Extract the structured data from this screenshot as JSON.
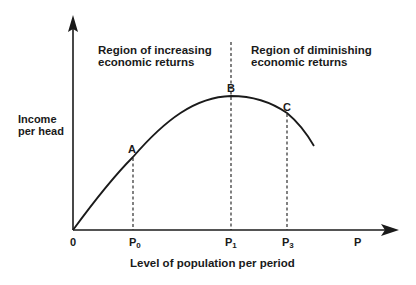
{
  "diagram": {
    "y_axis_label_line1": "Income",
    "y_axis_label_line2": "per head",
    "x_axis_label": "Level of population per period",
    "origin_label": "0",
    "region_left_line1": "Region of increasing",
    "region_left_line2": "economic returns",
    "region_right_line1": "Region of diminishing",
    "region_right_line2": "economic returns",
    "points": [
      {
        "label": "A",
        "x_tick": "P",
        "x_tick_sub": "0"
      },
      {
        "label": "B",
        "x_tick": "P",
        "x_tick_sub": "1"
      },
      {
        "label": "C",
        "x_tick": "P",
        "x_tick_sub": "3"
      }
    ],
    "x_axis_end_label": "P",
    "colors": {
      "line": "#1a1a1a",
      "background": "#ffffff"
    }
  }
}
